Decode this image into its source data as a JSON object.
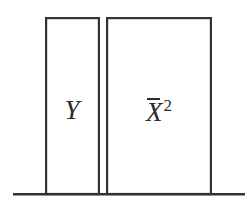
{
  "figure": {
    "title": "",
    "background_color": "#ffffff",
    "line_color": "#333333",
    "label_color": "#2b2b2b",
    "width": 250,
    "height": 211
  },
  "chart_data": {
    "type": "bar",
    "title": "",
    "xlabel": "",
    "ylabel": "",
    "grid": false,
    "legend": false,
    "orientation": "vertical",
    "baseline_y": 194,
    "axis_range_x": [
      13,
      245
    ],
    "categories": [
      "Y",
      "X²"
    ],
    "values": [
      1.0,
      1.0
    ],
    "bars": [
      {
        "label": "Y",
        "label_plain": "Y",
        "label_base": "Y",
        "label_has_overbar": false,
        "label_exponent": "",
        "value": 1.0,
        "x_left": 45,
        "x_right": 100,
        "y_top": 17,
        "y_bottom": 194,
        "width_px": 55,
        "height_px": 177,
        "fill": "#ffffff",
        "stroke": "#333333"
      },
      {
        "label": "X̄²",
        "label_plain": "Xbar^2",
        "label_base": "X",
        "label_has_overbar": true,
        "label_exponent": "2",
        "value": 1.0,
        "x_left": 106,
        "x_right": 212,
        "y_top": 17,
        "y_bottom": 194,
        "width_px": 106,
        "height_px": 177,
        "fill": "#ffffff",
        "stroke": "#333333"
      }
    ],
    "baseline": {
      "x_start": 13,
      "x_end": 245,
      "y": 194,
      "stroke": "#333333"
    }
  },
  "labels": {
    "left_bar": {
      "text": "Y"
    },
    "right_bar": {
      "base": "X",
      "exponent": "2"
    }
  }
}
